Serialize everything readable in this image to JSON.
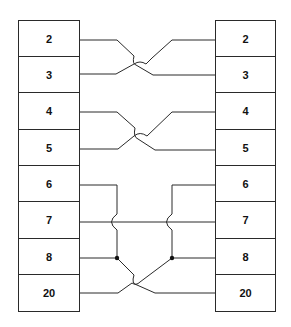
{
  "diagram": {
    "type": "pin-wiring",
    "left_connector": {
      "pins": [
        "2",
        "3",
        "4",
        "5",
        "6",
        "7",
        "8",
        "20"
      ]
    },
    "right_connector": {
      "pins": [
        "2",
        "3",
        "4",
        "5",
        "6",
        "7",
        "8",
        "20"
      ]
    },
    "connections": [
      {
        "from": "L2",
        "to": "R3",
        "crossing": true
      },
      {
        "from": "L3",
        "to": "R2",
        "crossing": true
      },
      {
        "from": "L4",
        "to": "R5",
        "crossing": true
      },
      {
        "from": "L5",
        "to": "R4",
        "crossing": true
      },
      {
        "from": "L6",
        "to": "L8",
        "junction": true,
        "hop_over": "7"
      },
      {
        "from": "R6",
        "to": "R8",
        "junction": true,
        "hop_over": "7"
      },
      {
        "from": "L7",
        "to": "R7",
        "straight": true
      },
      {
        "from": "L8",
        "to": "R20",
        "crossing": true
      },
      {
        "from": "R8",
        "to": "L20",
        "crossing": true
      }
    ],
    "line_color": "#2a2a2a"
  }
}
